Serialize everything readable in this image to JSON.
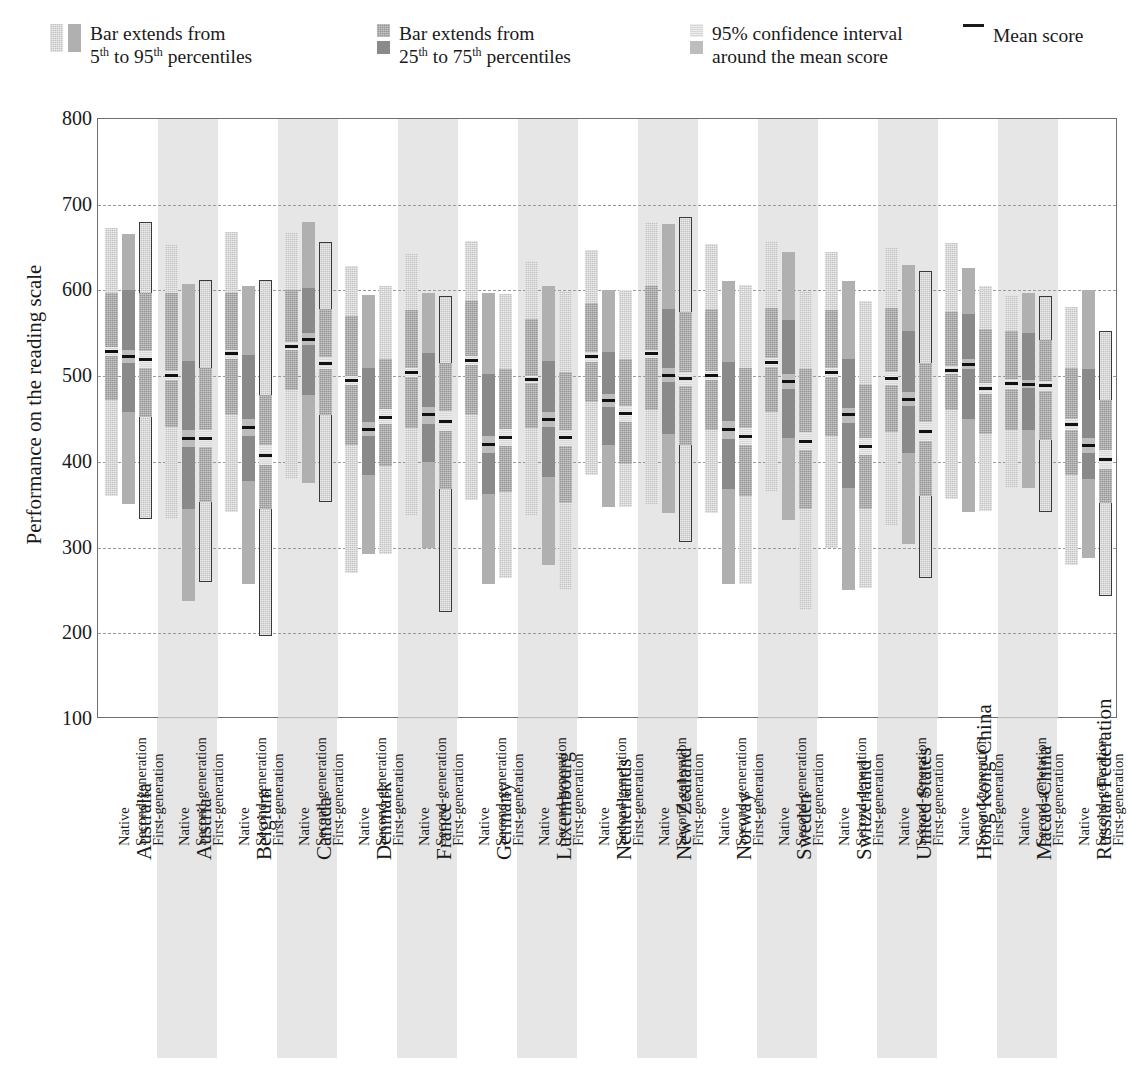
{
  "legend": {
    "items": [
      {
        "id": "p5-95",
        "line1": "Bar extends from",
        "line2_pre": "5",
        "line2_sup1": "th",
        "line2_mid": " to 95",
        "line2_sup2": "th",
        "line2_post": " percentiles",
        "swatch_a": "textured-light-gray",
        "swatch_b": "solid-gray"
      },
      {
        "id": "p25-75",
        "line1": "Bar extends from",
        "line2_pre": "25",
        "line2_sup1": "th",
        "line2_mid": " to 75",
        "line2_sup2": "th",
        "line2_post": " percentiles",
        "swatch_a": "textured-dark-gray",
        "swatch_b": "solid-dark-gray"
      },
      {
        "id": "ci95",
        "line1": "95% confidence interval",
        "line2": "around the mean score",
        "swatch_a": "textured-pale-gray",
        "swatch_b": "solid-pale-gray"
      },
      {
        "id": "mean",
        "label": "Mean score",
        "swatch": "black-line"
      }
    ]
  },
  "chart_data": {
    "type": "bar",
    "title": "",
    "xlabel": "",
    "ylabel": "Performance on the reading scale",
    "ylim": [
      100,
      800
    ],
    "yticks": [
      800,
      700,
      600,
      500,
      400,
      300,
      200,
      100
    ],
    "gridlines": [
      700,
      600,
      500,
      400,
      300,
      200
    ],
    "grid": true,
    "legend_position": "top",
    "series_names": [
      "Native",
      "Second-generation",
      "First-generation"
    ],
    "categories": [
      "Australia",
      "Austria",
      "Belgium",
      "Canada",
      "Denmark",
      "France",
      "Germany",
      "Luxembourg",
      "Netherlands",
      "New Zealand",
      "Norway",
      "Sweden",
      "Switzerland",
      "United States",
      "Hong Kong-China",
      "Macao-China",
      "Russian Federation"
    ],
    "groups": [
      {
        "country": "Australia",
        "shaded": false,
        "bars": [
          {
            "gen": "Native",
            "p5": 360,
            "p95": 673,
            "p25": 472,
            "p75": 597,
            "ci_lo": 524,
            "ci_hi": 534,
            "mean": 529,
            "outlined": false
          },
          {
            "gen": "Second-generation",
            "p5": 351,
            "p95": 666,
            "p25": 458,
            "p75": 600,
            "ci_lo": 515,
            "ci_hi": 531,
            "mean": 523,
            "outlined": false
          },
          {
            "gen": "First-generation",
            "p5": 333,
            "p95": 680,
            "p25": 452,
            "p75": 597,
            "ci_lo": 509,
            "ci_hi": 529,
            "mean": 519,
            "outlined": true
          }
        ]
      },
      {
        "country": "Austria",
        "shaded": true,
        "bars": [
          {
            "gen": "Native",
            "p5": 333,
            "p95": 653,
            "p25": 441,
            "p75": 597,
            "ci_lo": 495,
            "ci_hi": 506,
            "mean": 501,
            "outlined": false
          },
          {
            "gen": "Second-generation",
            "p5": 238,
            "p95": 607,
            "p25": 345,
            "p75": 518,
            "ci_lo": 417,
            "ci_hi": 437,
            "mean": 427,
            "outlined": false
          },
          {
            "gen": "First-generation",
            "p5": 260,
            "p95": 612,
            "p25": 353,
            "p75": 510,
            "ci_lo": 417,
            "ci_hi": 437,
            "mean": 427,
            "outlined": true
          }
        ]
      },
      {
        "country": "Belgium",
        "shaded": false,
        "bars": [
          {
            "gen": "Native",
            "p5": 342,
            "p95": 668,
            "p25": 455,
            "p75": 597,
            "ci_lo": 520,
            "ci_hi": 531,
            "mean": 526,
            "outlined": false
          },
          {
            "gen": "Second-generation",
            "p5": 257,
            "p95": 605,
            "p25": 378,
            "p75": 525,
            "ci_lo": 430,
            "ci_hi": 450,
            "mean": 440,
            "outlined": false
          },
          {
            "gen": "First-generation",
            "p5": 197,
            "p95": 612,
            "p25": 345,
            "p75": 478,
            "ci_lo": 396,
            "ci_hi": 420,
            "mean": 408,
            "outlined": true
          }
        ]
      },
      {
        "country": "Canada",
        "shaded": true,
        "bars": [
          {
            "gen": "Native",
            "p5": 380,
            "p95": 667,
            "p25": 484,
            "p75": 600,
            "ci_lo": 530,
            "ci_hi": 540,
            "mean": 535,
            "outlined": false
          },
          {
            "gen": "Second-generation",
            "p5": 375,
            "p95": 680,
            "p25": 478,
            "p75": 603,
            "ci_lo": 536,
            "ci_hi": 550,
            "mean": 543,
            "outlined": false
          },
          {
            "gen": "First-generation",
            "p5": 353,
            "p95": 656,
            "p25": 455,
            "p75": 578,
            "ci_lo": 508,
            "ci_hi": 522,
            "mean": 515,
            "outlined": true
          }
        ]
      },
      {
        "country": "Denmark",
        "shaded": false,
        "bars": [
          {
            "gen": "Native",
            "p5": 270,
            "p95": 628,
            "p25": 420,
            "p75": 570,
            "ci_lo": 490,
            "ci_hi": 500,
            "mean": 495,
            "outlined": false
          },
          {
            "gen": "Second-generation",
            "p5": 293,
            "p95": 595,
            "p25": 385,
            "p75": 510,
            "ci_lo": 430,
            "ci_hi": 447,
            "mean": 438,
            "outlined": false
          },
          {
            "gen": "First-generation",
            "p5": 292,
            "p95": 605,
            "p25": 395,
            "p75": 520,
            "ci_lo": 444,
            "ci_hi": 462,
            "mean": 452,
            "outlined": false
          }
        ]
      },
      {
        "country": "France",
        "shaded": true,
        "bars": [
          {
            "gen": "Native",
            "p5": 337,
            "p95": 643,
            "p25": 440,
            "p75": 577,
            "ci_lo": 499,
            "ci_hi": 509,
            "mean": 504,
            "outlined": false
          },
          {
            "gen": "Second-generation",
            "p5": 299,
            "p95": 597,
            "p25": 400,
            "p75": 527,
            "ci_lo": 444,
            "ci_hi": 464,
            "mean": 455,
            "outlined": false
          },
          {
            "gen": "First-generation",
            "p5": 225,
            "p95": 593,
            "p25": 368,
            "p75": 515,
            "ci_lo": 436,
            "ci_hi": 459,
            "mean": 447,
            "outlined": true
          }
        ]
      },
      {
        "country": "Germany",
        "shaded": false,
        "bars": [
          {
            "gen": "Native",
            "p5": 355,
            "p95": 658,
            "p25": 455,
            "p75": 588,
            "ci_lo": 513,
            "ci_hi": 523,
            "mean": 518,
            "outlined": false
          },
          {
            "gen": "Second-generation",
            "p5": 257,
            "p95": 597,
            "p25": 362,
            "p75": 502,
            "ci_lo": 410,
            "ci_hi": 430,
            "mean": 420,
            "outlined": false
          },
          {
            "gen": "First-generation",
            "p5": 265,
            "p95": 596,
            "p25": 365,
            "p75": 508,
            "ci_lo": 418,
            "ci_hi": 438,
            "mean": 428,
            "outlined": false
          }
        ]
      },
      {
        "country": "Luxembourg",
        "shaded": true,
        "bars": [
          {
            "gen": "Native",
            "p5": 337,
            "p95": 634,
            "p25": 440,
            "p75": 567,
            "ci_lo": 492,
            "ci_hi": 500,
            "mean": 496,
            "outlined": false
          },
          {
            "gen": "Second-generation",
            "p5": 280,
            "p95": 605,
            "p25": 382,
            "p75": 518,
            "ci_lo": 441,
            "ci_hi": 458,
            "mean": 450,
            "outlined": false
          },
          {
            "gen": "First-generation",
            "p5": 251,
            "p95": 599,
            "p25": 352,
            "p75": 505,
            "ci_lo": 419,
            "ci_hi": 437,
            "mean": 428,
            "outlined": false
          }
        ]
      },
      {
        "country": "Netherlands",
        "shaded": false,
        "bars": [
          {
            "gen": "Native",
            "p5": 385,
            "p95": 647,
            "p25": 470,
            "p75": 585,
            "ci_lo": 517,
            "ci_hi": 528,
            "mean": 523,
            "outlined": false
          },
          {
            "gen": "Second-generation",
            "p5": 347,
            "p95": 600,
            "p25": 420,
            "p75": 528,
            "ci_lo": 464,
            "ci_hi": 479,
            "mean": 472,
            "outlined": false
          },
          {
            "gen": "First-generation",
            "p5": 347,
            "p95": 600,
            "p25": 398,
            "p75": 520,
            "ci_lo": 447,
            "ci_hi": 465,
            "mean": 456,
            "outlined": false
          }
        ]
      },
      {
        "country": "New Zealand",
        "shaded": true,
        "bars": [
          {
            "gen": "Native",
            "p5": 350,
            "p95": 680,
            "p25": 460,
            "p75": 605,
            "ci_lo": 521,
            "ci_hi": 531,
            "mean": 526,
            "outlined": false
          },
          {
            "gen": "Second-generation",
            "p5": 340,
            "p95": 678,
            "p25": 432,
            "p75": 578,
            "ci_lo": 493,
            "ci_hi": 509,
            "mean": 501,
            "outlined": false
          },
          {
            "gen": "First-generation",
            "p5": 307,
            "p95": 686,
            "p25": 420,
            "p75": 575,
            "ci_lo": 488,
            "ci_hi": 505,
            "mean": 497,
            "outlined": true
          }
        ]
      },
      {
        "country": "Norway",
        "shaded": false,
        "bars": [
          {
            "gen": "Native",
            "p5": 340,
            "p95": 654,
            "p25": 437,
            "p75": 578,
            "ci_lo": 496,
            "ci_hi": 506,
            "mean": 501,
            "outlined": false
          },
          {
            "gen": "Second-generation",
            "p5": 258,
            "p95": 611,
            "p25": 368,
            "p75": 517,
            "ci_lo": 427,
            "ci_hi": 448,
            "mean": 438,
            "outlined": false
          },
          {
            "gen": "First-generation",
            "p5": 257,
            "p95": 606,
            "p25": 360,
            "p75": 510,
            "ci_lo": 420,
            "ci_hi": 440,
            "mean": 430,
            "outlined": false
          }
        ]
      },
      {
        "country": "Sweden",
        "shaded": true,
        "bars": [
          {
            "gen": "Native",
            "p5": 365,
            "p95": 658,
            "p25": 458,
            "p75": 580,
            "ci_lo": 511,
            "ci_hi": 521,
            "mean": 516,
            "outlined": false
          },
          {
            "gen": "Second-generation",
            "p5": 332,
            "p95": 645,
            "p25": 428,
            "p75": 565,
            "ci_lo": 485,
            "ci_hi": 502,
            "mean": 494,
            "outlined": false
          },
          {
            "gen": "First-generation",
            "p5": 227,
            "p95": 599,
            "p25": 345,
            "p75": 508,
            "ci_lo": 414,
            "ci_hi": 435,
            "mean": 424,
            "outlined": false
          }
        ]
      },
      {
        "country": "Switzerland",
        "shaded": false,
        "bars": [
          {
            "gen": "Native",
            "p5": 300,
            "p95": 645,
            "p25": 430,
            "p75": 577,
            "ci_lo": 499,
            "ci_hi": 509,
            "mean": 504,
            "outlined": false
          },
          {
            "gen": "Second-generation",
            "p5": 250,
            "p95": 611,
            "p25": 370,
            "p75": 520,
            "ci_lo": 445,
            "ci_hi": 463,
            "mean": 455,
            "outlined": false
          },
          {
            "gen": "First-generation",
            "p5": 253,
            "p95": 588,
            "p25": 345,
            "p75": 490,
            "ci_lo": 408,
            "ci_hi": 428,
            "mean": 418,
            "outlined": false
          }
        ]
      },
      {
        "country": "United States",
        "shaded": true,
        "bars": [
          {
            "gen": "Native",
            "p5": 325,
            "p95": 651,
            "p25": 435,
            "p75": 580,
            "ci_lo": 490,
            "ci_hi": 505,
            "mean": 497,
            "outlined": false
          },
          {
            "gen": "Second-generation",
            "p5": 304,
            "p95": 630,
            "p25": 410,
            "p75": 553,
            "ci_lo": 465,
            "ci_hi": 482,
            "mean": 473,
            "outlined": false
          },
          {
            "gen": "First-generation",
            "p5": 265,
            "p95": 623,
            "p25": 360,
            "p75": 515,
            "ci_lo": 424,
            "ci_hi": 447,
            "mean": 436,
            "outlined": true
          }
        ]
      },
      {
        "country": "Hong Kong-China",
        "shaded": false,
        "bars": [
          {
            "gen": "Native",
            "p5": 357,
            "p95": 655,
            "p25": 460,
            "p75": 575,
            "ci_lo": 502,
            "ci_hi": 512,
            "mean": 507,
            "outlined": false
          },
          {
            "gen": "Second-generation",
            "p5": 341,
            "p95": 626,
            "p25": 450,
            "p75": 572,
            "ci_lo": 508,
            "ci_hi": 520,
            "mean": 514,
            "outlined": false
          },
          {
            "gen": "First-generation",
            "p5": 343,
            "p95": 605,
            "p25": 433,
            "p75": 555,
            "ci_lo": 479,
            "ci_hi": 492,
            "mean": 486,
            "outlined": false
          }
        ]
      },
      {
        "country": "Macao-China",
        "shaded": true,
        "bars": [
          {
            "gen": "Native",
            "p5": 370,
            "p95": 593,
            "p25": 437,
            "p75": 553,
            "ci_lo": 485,
            "ci_hi": 497,
            "mean": 491,
            "outlined": false
          },
          {
            "gen": "Second-generation",
            "p5": 370,
            "p95": 597,
            "p25": 437,
            "p75": 550,
            "ci_lo": 486,
            "ci_hi": 495,
            "mean": 490,
            "outlined": false
          },
          {
            "gen": "First-generation",
            "p5": 342,
            "p95": 594,
            "p25": 425,
            "p75": 542,
            "ci_lo": 483,
            "ci_hi": 494,
            "mean": 489,
            "outlined": true
          }
        ]
      },
      {
        "country": "Russian Federation",
        "shaded": false,
        "bars": [
          {
            "gen": "Native",
            "p5": 280,
            "p95": 581,
            "p25": 385,
            "p75": 510,
            "ci_lo": 437,
            "ci_hi": 450,
            "mean": 444,
            "outlined": false
          },
          {
            "gen": "Second-generation",
            "p5": 288,
            "p95": 600,
            "p25": 380,
            "p75": 508,
            "ci_lo": 410,
            "ci_hi": 428,
            "mean": 419,
            "outlined": false
          },
          {
            "gen": "First-generation",
            "p5": 243,
            "p95": 553,
            "p25": 352,
            "p75": 472,
            "ci_lo": 392,
            "ci_hi": 414,
            "mean": 403,
            "outlined": true
          }
        ]
      }
    ]
  }
}
